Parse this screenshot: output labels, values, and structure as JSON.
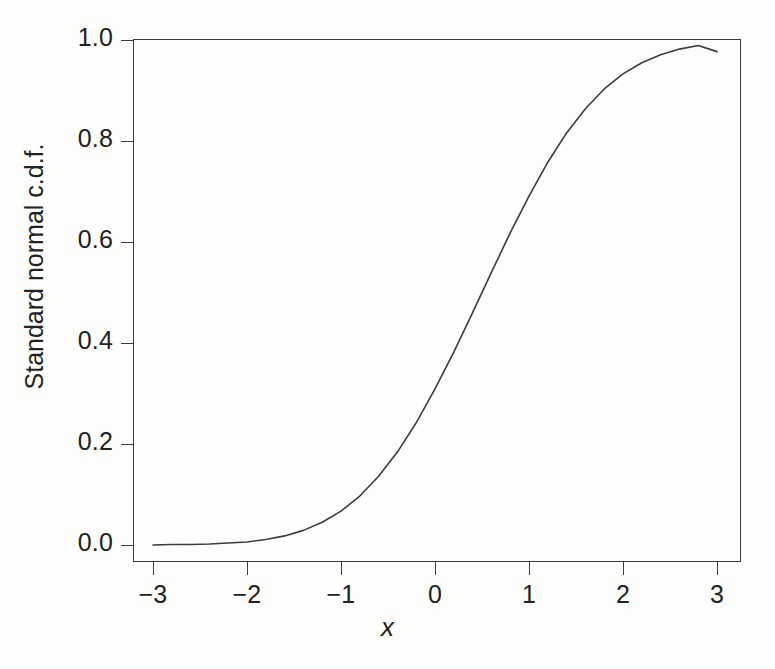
{
  "figure": {
    "background_color": "#fdfdfb",
    "line_color": "#3c3c3c",
    "text_color": "#222222"
  },
  "axes": {
    "x_label": "x",
    "y_label": "Standard normal c.d.f."
  },
  "chart_data": {
    "type": "line",
    "title": "",
    "subtitle": "",
    "xlabel": "x",
    "ylabel": "Standard normal c.d.f.",
    "xlim": [
      -3.25,
      3.25
    ],
    "ylim": [
      -0.02,
      1.02
    ],
    "xticks": [
      -3,
      -2,
      -1,
      0,
      1,
      2,
      3
    ],
    "xtick_labels": [
      "−3",
      "−2",
      "−1",
      "0",
      "1",
      "2",
      "3"
    ],
    "yticks": [
      0.0,
      0.2,
      0.4,
      0.6,
      0.8,
      1.0
    ],
    "ytick_labels": [
      "0.0",
      "0.2",
      "0.4",
      "0.6",
      "0.8",
      "1.0"
    ],
    "grid": false,
    "legend": false,
    "legend_position": "none",
    "series": [
      {
        "name": "Standard normal c.d.f.",
        "color": "#3c3c3c",
        "line_width": 1.6,
        "x": [
          -3.0,
          -2.8,
          -2.6,
          -2.4,
          -2.2,
          -2.0,
          -1.8,
          -1.6,
          -1.4,
          -1.2,
          -1.0,
          -0.8,
          -0.6,
          -0.4,
          -0.2,
          0.0,
          0.2,
          0.4,
          0.6,
          0.8,
          1.0,
          1.2,
          1.4,
          1.6,
          1.8,
          2.0,
          2.2,
          2.4,
          2.6,
          2.8,
          3.0
        ],
        "y": [
          0.0,
          0.001,
          0.001,
          0.002,
          0.004,
          0.006,
          0.011,
          0.018,
          0.029,
          0.045,
          0.067,
          0.097,
          0.136,
          0.184,
          0.242,
          0.309,
          0.382,
          0.46,
          0.54,
          0.618,
          0.691,
          0.758,
          0.816,
          0.864,
          0.903,
          0.933,
          0.955,
          0.971,
          0.982,
          0.989,
          0.977
        ]
      }
    ]
  },
  "ytick_positions_px": [
    545,
    444,
    343,
    242,
    141,
    40
  ],
  "xtick_positions_px": [
    153,
    247,
    341,
    435,
    529,
    623,
    717
  ]
}
